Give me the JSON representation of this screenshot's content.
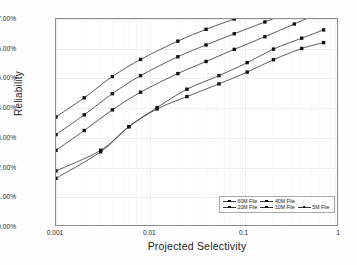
{
  "chart_data": {
    "type": "line",
    "title": "",
    "subtitle": "",
    "xlabel": "Projected Selectivity",
    "ylabel": "Reliability",
    "xscale": "log",
    "yscale": "linear",
    "xlim": [
      0.001,
      1
    ],
    "ylim": [
      0.9,
      0.97
    ],
    "xticks": [
      0.001,
      0.01,
      0.1,
      1
    ],
    "xticklabels": [
      "0.001",
      "0.01",
      "0.1",
      "1"
    ],
    "yticks": [
      0.9,
      0.91,
      0.92,
      0.93,
      0.94,
      0.95,
      0.96,
      0.97
    ],
    "yticklabels": [
      "90.00%",
      "91.00%",
      "92.00%",
      "93.00%",
      "94.00%",
      "95.00%",
      "96.00%",
      "97.00%"
    ],
    "grid": true,
    "legend_position": "lower right",
    "legend_entries": [
      "60M File",
      "40M File",
      "20M File",
      "10M File",
      "5M File"
    ],
    "marker": "square",
    "line_color": "#333333",
    "series": [
      {
        "name": "5M File",
        "x": [
          0.001,
          0.002,
          0.004,
          0.008,
          0.02,
          0.04,
          0.08,
          0.17,
          0.35,
          0.7
        ],
        "values": [
          0.9368,
          0.9433,
          0.9505,
          0.9563,
          0.9625,
          0.9665,
          0.97,
          0.9737,
          0.9775,
          0.9812
        ]
      },
      {
        "name": "10M File",
        "x": [
          0.001,
          0.002,
          0.004,
          0.008,
          0.02,
          0.04,
          0.08,
          0.17,
          0.35,
          0.7
        ],
        "values": [
          0.9308,
          0.9375,
          0.9447,
          0.9508,
          0.9572,
          0.9612,
          0.965,
          0.969,
          0.973,
          0.977
        ]
      },
      {
        "name": "20M File",
        "x": [
          0.001,
          0.002,
          0.004,
          0.008,
          0.02,
          0.04,
          0.08,
          0.17,
          0.35,
          0.7
        ],
        "values": [
          0.9255,
          0.9322,
          0.9392,
          0.9452,
          0.9515,
          0.9556,
          0.9597,
          0.964,
          0.9683,
          0.9725
        ]
      },
      {
        "name": "40M File",
        "x": [
          0.001,
          0.003,
          0.006,
          0.012,
          0.025,
          0.055,
          0.11,
          0.21,
          0.42,
          0.72
        ],
        "values": [
          0.9185,
          0.9255,
          0.9335,
          0.94,
          0.9462,
          0.9508,
          0.9552,
          0.9598,
          0.9635,
          0.9663
        ]
      },
      {
        "name": "60M File",
        "x": [
          0.001,
          0.003,
          0.006,
          0.012,
          0.025,
          0.055,
          0.11,
          0.21,
          0.42,
          0.72
        ],
        "values": [
          0.916,
          0.925,
          0.9335,
          0.9395,
          0.9437,
          0.948,
          0.952,
          0.9562,
          0.96,
          0.962
        ]
      }
    ]
  },
  "axes": {
    "ylabel": "Reliability",
    "xlabel": "Projected Selectivity",
    "yticklabels": [
      "97.00%",
      "96.00%",
      "95.00%",
      "94.00%",
      "93.00%",
      "92.00%",
      "91.00%",
      "90.00%"
    ],
    "xticklabels": [
      "0.001",
      "0.01",
      "0.1",
      "1"
    ]
  },
  "legend": {
    "items": [
      {
        "label": "60M File"
      },
      {
        "label": "40M File"
      },
      {
        "label": "20M File"
      },
      {
        "label": "10M File"
      },
      {
        "label": "5M File"
      }
    ]
  }
}
